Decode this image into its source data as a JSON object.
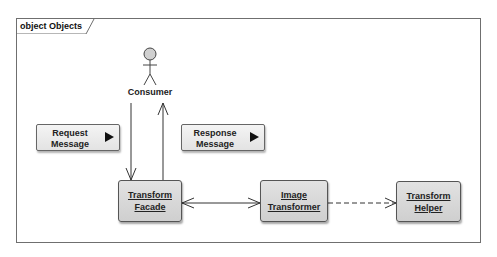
{
  "frame": {
    "kind": "object",
    "title": "object Objects"
  },
  "actor": {
    "name": "Consumer",
    "icon": "stick-figure-icon"
  },
  "messages": [
    {
      "id": "request",
      "line1": "Request",
      "line2": "Message",
      "icon": "right-triangle-icon"
    },
    {
      "id": "response",
      "line1": "Response",
      "line2": "Message",
      "icon": "right-triangle-icon"
    }
  ],
  "objects": [
    {
      "id": "transform-facade",
      "line1": "Transform",
      "line2": "Facade"
    },
    {
      "id": "image-transformer",
      "line1": "Image",
      "line2": "Transformer"
    },
    {
      "id": "transform-helper",
      "line1": "Transform",
      "line2": "Helper"
    }
  ],
  "connectors": [
    {
      "from": "Consumer",
      "to": "Transform Facade",
      "style": "solid",
      "arrow": "open"
    },
    {
      "from": "Transform Facade",
      "to": "Consumer",
      "style": "solid",
      "arrow": "open"
    },
    {
      "from": "Transform Facade",
      "to": "Image Transformer",
      "style": "solid",
      "arrow": "both-open"
    },
    {
      "from": "Image Transformer",
      "to": "Transform Helper",
      "style": "dashed",
      "arrow": "open"
    }
  ],
  "colors": {
    "node_fill": "#d8d8d8",
    "message_fill": "#ececec",
    "line": "#333333",
    "frame": "#6f6f6f"
  }
}
